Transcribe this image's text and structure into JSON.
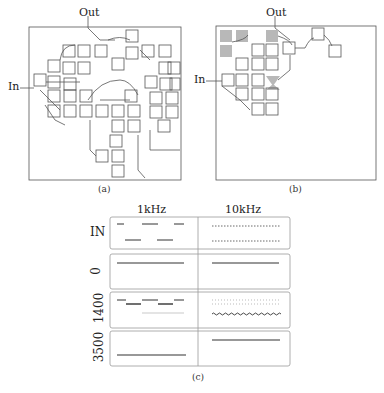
{
  "panel_a": {
    "caption": "(a)",
    "input_label": "In",
    "output_label": "Out"
  },
  "panel_b": {
    "caption": "(b)",
    "input_label": "In",
    "output_label": "Out"
  },
  "panel_c": {
    "caption": "(c)",
    "columns": [
      "1kHz",
      "10kHz"
    ],
    "rows": [
      "IN",
      "0",
      "1400",
      "3500"
    ]
  }
}
